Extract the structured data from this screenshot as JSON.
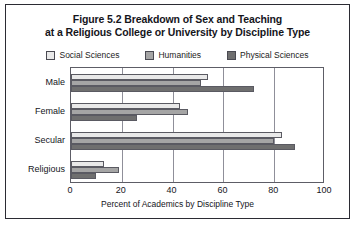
{
  "chart_data": {
    "type": "bar",
    "orientation": "horizontal",
    "title": "Figure 5.2 Breakdown of Sex and Teaching at a Religious College or University by Discipline Type",
    "title_line1": "Figure 5.2 Breakdown of Sex and Teaching",
    "title_line2": "at a Religious College or University by Discipline Type",
    "categories": [
      "Male",
      "Female",
      "Secular",
      "Religious"
    ],
    "series": [
      {
        "name": "Social Sciences",
        "color": "#e9e9e9",
        "values": [
          54,
          43,
          83,
          13
        ]
      },
      {
        "name": "Humanities",
        "color": "#a5a5a5",
        "values": [
          51,
          46,
          80,
          19
        ]
      },
      {
        "name": "Physical Sciences",
        "color": "#6f6f6f",
        "values": [
          72,
          26,
          88,
          10
        ]
      }
    ],
    "xlabel": "Percent of Academics by Discipline Type",
    "ylabel": "",
    "xlim": [
      0,
      100
    ],
    "xticks": [
      0,
      20,
      40,
      60,
      80,
      100
    ],
    "xtick_labels": [
      "0",
      "20",
      "40",
      "60",
      "80",
      "100"
    ],
    "grid": "vertical",
    "legend_position": "top-center"
  },
  "colors": {
    "frame": "#2b2b33",
    "plot_border": "#5d5d66",
    "gridline": "#8f8f99",
    "text": "#15151b",
    "background": "#ffffff"
  }
}
